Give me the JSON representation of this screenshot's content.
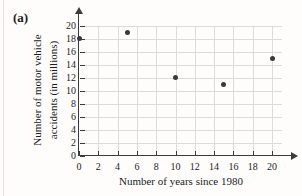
{
  "figure_label": "(a)",
  "chart_data": {
    "type": "scatter",
    "title": "",
    "xlabel": "Number of years since 1980",
    "ylabel": "Number of motor vehicle accidents (in millions)",
    "ylabel_lines": [
      "Number of motor vehicle",
      "accidents (in millions)"
    ],
    "points": [
      [
        0,
        18
      ],
      [
        5,
        19
      ],
      [
        10,
        12
      ],
      [
        15,
        11
      ],
      [
        20,
        15
      ]
    ],
    "xticks": [
      "0",
      "2",
      "4",
      "6",
      "8",
      "10",
      "12",
      "14",
      "16",
      "18",
      "20"
    ],
    "yticks": [
      "0",
      "2",
      "4",
      "6",
      "8",
      "10",
      "12",
      "14",
      "16",
      "18",
      "20"
    ],
    "xlim": [
      0,
      21
    ],
    "ylim": [
      0,
      21
    ],
    "grid": "on",
    "legend": "none",
    "colors": {
      "point": "#3a3a3a",
      "axis": "#3b3b3b",
      "grid": "#dcdcdc",
      "text": "#1c1c1c",
      "background": "#fefdfc"
    }
  }
}
